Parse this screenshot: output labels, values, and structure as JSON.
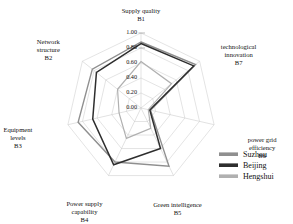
{
  "chart_data": {
    "type": "radar",
    "title": "",
    "categories": [
      "Supply quality B1",
      "technological innovation B7",
      "power grid efficiency B6",
      "Green intelligence B5",
      "Power supply capability B4",
      "Equipment levels B3",
      "Network structure B2"
    ],
    "axes": [
      {
        "code": "B1",
        "name": "Supply quality",
        "line1": "Supply quality",
        "line2": "B1"
      },
      {
        "code": "B7",
        "name": "technological innovation",
        "line1": "technological",
        "line2": "innovation",
        "line3": "B7"
      },
      {
        "code": "B6",
        "name": "power grid efficiency",
        "line1": "power grid",
        "line2": "efficiency",
        "line3": "B6"
      },
      {
        "code": "B5",
        "name": "Green intelligence",
        "line1": "Green intelligence",
        "line2": "B5"
      },
      {
        "code": "B4",
        "name": "Power supply capability",
        "line1": "Power supply",
        "line2": "capability",
        "line3": "B4"
      },
      {
        "code": "B3",
        "name": "Equipment levels",
        "line1": "Equipment",
        "line2": "levels",
        "line3": "B3"
      },
      {
        "code": "B2",
        "name": "Network structure",
        "line1": "Network",
        "line2": "structure",
        "line3": "B2"
      }
    ],
    "tick_labels": [
      "1.00",
      "0.80",
      "0.60",
      "0.40",
      "0.20",
      "0.00"
    ],
    "tick_values": [
      1.0,
      0.8,
      0.6,
      0.4,
      0.2,
      0.0
    ],
    "rlim": [
      0.0,
      1.0
    ],
    "grid": true,
    "legend_position": "right",
    "series": [
      {
        "name": "Suzhou",
        "color": "#8f8f8f",
        "width": 1.4,
        "values": [
          0.88,
          0.93,
          0.13,
          0.86,
          0.8,
          0.86,
          0.83
        ]
      },
      {
        "name": "Beijing",
        "color": "#2e2e2e",
        "width": 1.5,
        "values": [
          0.86,
          0.9,
          0.12,
          0.6,
          0.84,
          0.66,
          0.76
        ]
      },
      {
        "name": "Hengshui",
        "color": "#b0b0b0",
        "width": 1.2,
        "values": [
          0.62,
          0.52,
          0.1,
          0.3,
          0.45,
          0.3,
          0.4
        ]
      }
    ]
  },
  "legend": {
    "items": [
      {
        "label": "Suzhou",
        "color": "#8f8f8f"
      },
      {
        "label": "Beijing",
        "color": "#2e2e2e"
      },
      {
        "label": "Hengshui",
        "color": "#b0b0b0"
      }
    ]
  }
}
